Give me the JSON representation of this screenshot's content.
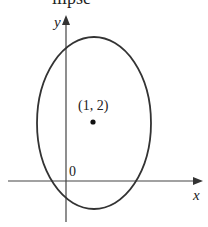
{
  "title_fragment": "llipse",
  "diagram": {
    "axes": {
      "x_label": "x",
      "y_label": "y",
      "origin_label": "0"
    },
    "ellipse": {
      "center_label": "(1, 2)"
    }
  }
}
